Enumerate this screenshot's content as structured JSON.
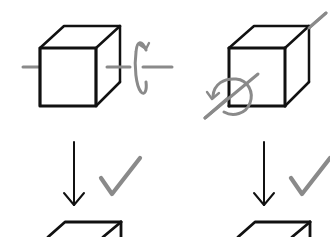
{
  "diagram": {
    "colors": {
      "background": "#ffffff",
      "ink": "#111111",
      "axis_and_check": "#8a8a8a"
    },
    "panels": [
      {
        "id": "left",
        "axis": "horizontal",
        "rotation_icon": "rotate-around-horizontal-axis-icon",
        "arrow": "arrow-down-icon",
        "check": "check-icon",
        "result": "cube-partial"
      },
      {
        "id": "right",
        "axis": "diagonal",
        "rotation_icon": "rotate-around-diagonal-axis-icon",
        "arrow": "arrow-down-icon",
        "check": "check-icon",
        "result": "cube-partial"
      }
    ]
  }
}
